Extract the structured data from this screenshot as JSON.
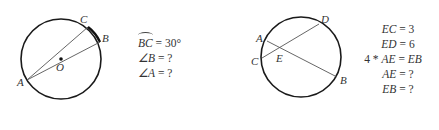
{
  "figures": [
    {
      "id": "left",
      "circle": {
        "cx": 61,
        "cy": 59,
        "r": 40
      },
      "points": {
        "A": {
          "x": 27,
          "y": 80,
          "label": "A",
          "lx": 17,
          "ly": 86
        },
        "B": {
          "x": 100,
          "y": 42,
          "label": "B",
          "lx": 102,
          "ly": 42
        },
        "C": {
          "x": 88,
          "y": 27,
          "label": "C",
          "lx": 80,
          "ly": 23
        },
        "O": {
          "x": 61,
          "y": 59,
          "label": "O",
          "lx": 57,
          "ly": 70
        }
      },
      "equations": [
        {
          "lhs": "BC",
          "arc": true,
          "rhs": "= 30°"
        },
        {
          "lhs": "∠B",
          "rhs": "= ?"
        },
        {
          "lhs": "∠A",
          "rhs": "= ?"
        }
      ]
    },
    {
      "id": "right",
      "circle": {
        "cx": 301,
        "cy": 57,
        "r": 40
      },
      "points": {
        "A": {
          "x": 267,
          "y": 41,
          "label": "A",
          "lx": 257,
          "ly": 42
        },
        "B": {
          "x": 337,
          "y": 77,
          "label": "B",
          "lx": 340,
          "ly": 84
        },
        "C": {
          "x": 262,
          "y": 58,
          "label": "C",
          "lx": 251,
          "ly": 65
        },
        "D": {
          "x": 319,
          "y": 24,
          "label": "D",
          "lx": 321,
          "ly": 23
        },
        "E": {
          "x": 279,
          "y": 50,
          "label": "E",
          "lx": 277,
          "ly": 62
        }
      },
      "equations": [
        {
          "text": "EC = 3"
        },
        {
          "text": "ED = 6"
        },
        {
          "text": "4 * AE = EB"
        },
        {
          "text": "AE = ?"
        },
        {
          "text": "EB = ?"
        }
      ]
    }
  ],
  "labels": {
    "left_A": "A",
    "left_B": "B",
    "left_C": "C",
    "left_O": "O",
    "right_A": "A",
    "right_B": "B",
    "right_C": "C",
    "right_D": "D",
    "right_E": "E"
  },
  "left_eq": {
    "arc_lhs": "BC",
    "arc_rhs": "= 30°",
    "angle_b_lhs": "∠B",
    "angle_b_rhs": "= ?",
    "angle_a_lhs": "∠A",
    "angle_a_rhs": "= ?"
  },
  "right_eq": {
    "ec_lhs": "EC",
    "ec_rhs": "= 3",
    "ed_lhs": "ED",
    "ed_rhs": "= 6",
    "rel_prefix": "4 * ",
    "rel_ae": "AE",
    "rel_eq": " = ",
    "rel_eb": "EB",
    "ae_lhs": "AE",
    "ae_rhs": "= ?",
    "eb_lhs": "EB",
    "eb_rhs": "= ?"
  },
  "colors": {
    "circle": "#1a1a1a",
    "chord": "#555555",
    "text": "#333333"
  }
}
